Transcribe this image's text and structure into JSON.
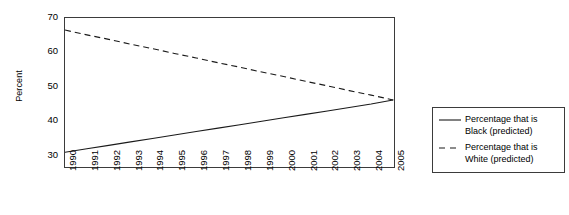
{
  "chart_data": {
    "type": "line",
    "title": "",
    "xlabel": "",
    "ylabel": "Percent",
    "x": [
      1990,
      1991,
      1992,
      1993,
      1994,
      1995,
      1996,
      1997,
      1998,
      1999,
      2000,
      2001,
      2002,
      2003,
      2004,
      2005
    ],
    "xtick_labels": [
      "1990",
      "1991",
      "1992",
      "1993",
      "1994",
      "1995",
      "1996",
      "1997",
      "1998",
      "1999",
      "2000",
      "2001",
      "2002",
      "2003",
      "2004",
      "2005"
    ],
    "ytick_labels": [
      "30",
      "40",
      "50",
      "60",
      "70"
    ],
    "ytick_values": [
      30,
      40,
      50,
      60,
      70
    ],
    "ylim": [
      27,
      70
    ],
    "xlim": [
      1990,
      2005
    ],
    "grid": false,
    "legend_position": "right",
    "series": [
      {
        "name": "Percentage that is Black (predicted)",
        "label_line_1": "Percentage that is",
        "label_line_2": "Black (predicted)",
        "style": "solid",
        "color": "#1a1a1a",
        "values": [
          31.0,
          32.0,
          33.0,
          34.0,
          35.0,
          36.0,
          37.0,
          38.0,
          39.0,
          40.0,
          41.0,
          42.0,
          43.0,
          44.0,
          45.0,
          46.2
        ]
      },
      {
        "name": "Percentage that is White (predicted)",
        "label_line_1": "Percentage that is",
        "label_line_2": "White (predicted)",
        "style": "dashed",
        "color": "#1a1a1a",
        "values": [
          66.5,
          65.1,
          63.8,
          62.4,
          61.1,
          59.7,
          58.4,
          57.0,
          55.7,
          54.3,
          53.0,
          51.6,
          50.3,
          48.9,
          47.6,
          46.2
        ]
      }
    ]
  },
  "legend": {
    "entries": [
      {
        "line_1": "Percentage that is",
        "line_2": "Black (predicted)"
      },
      {
        "line_1": "Percentage that is",
        "line_2": "White (predicted)"
      }
    ]
  }
}
